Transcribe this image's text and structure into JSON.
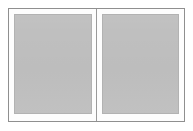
{
  "document": {
    "title": "Two-Page Spread Placeholder",
    "view_mode": "two-page-spread",
    "background_color": "#ffffff"
  },
  "frame": {
    "name": "spread-frame",
    "border_color": "#8f8f8f",
    "fill_color": "#fdfdfd",
    "border_width_px": 1
  },
  "gutter": {
    "name": "gutter-divider",
    "color": "#9a9a9a",
    "width_px": 1
  },
  "pages": [
    {
      "side": "left",
      "label": "Left page",
      "fill_color": "#bfbfbf",
      "border_color": "#b2b2b2",
      "content": ""
    },
    {
      "side": "right",
      "label": "Right page",
      "fill_color": "#bfbfbf",
      "border_color": "#b2b2b2",
      "content": ""
    }
  ]
}
